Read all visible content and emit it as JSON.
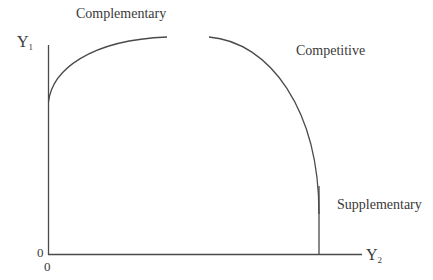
{
  "diagram": {
    "labels": {
      "complementary": "Complementary",
      "competitive": "Competitive",
      "supplementary": "Supplementary"
    },
    "axes": {
      "y_label": "Y",
      "y_sub": "1",
      "x_label": "Y",
      "x_sub": "2",
      "origin_y": "0",
      "origin_x": "0"
    },
    "colors": {
      "line": "#4a4a4a",
      "text": "#3a3a3a",
      "background": "#ffffff"
    }
  }
}
